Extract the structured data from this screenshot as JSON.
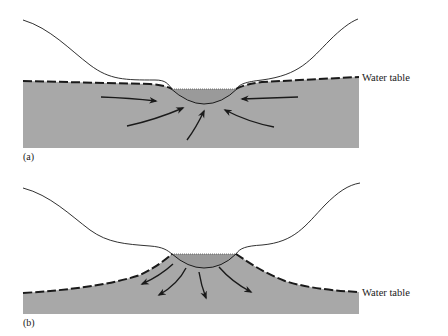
{
  "panels": [
    {
      "id": "a",
      "label": "(a)",
      "water_table_label": "Water table",
      "description": "Gaining stream: water table above stream bed, groundwater flows into the stream",
      "flow_direction": "toward-stream"
    },
    {
      "id": "b",
      "label": "(b)",
      "water_table_label": "Water table",
      "description": "Losing stream: water table below stream bed, water flows out of the stream into the ground",
      "flow_direction": "away-from-stream"
    }
  ],
  "colors": {
    "ground": "#a8a8a8",
    "line": "#1a1a1a",
    "background": "#ffffff"
  }
}
